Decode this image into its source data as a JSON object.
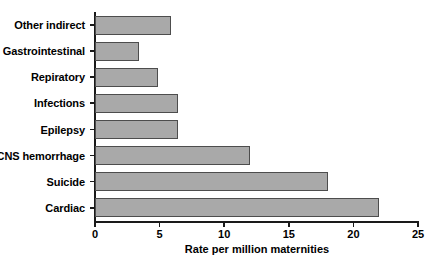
{
  "chart_data": {
    "type": "bar",
    "orientation": "horizontal",
    "title": "",
    "xlabel": "Rate per million maternities",
    "ylabel": "",
    "xlim": [
      0,
      25
    ],
    "xticks": [
      0,
      5,
      10,
      15,
      20,
      25
    ],
    "xtick_labels": [
      "0",
      "5",
      "10",
      "15",
      "20",
      "25"
    ],
    "grid": false,
    "legend": null,
    "bar_fill_color": "#a9a9a9",
    "bar_edge_color": "#4d4d4d",
    "axis_color": "#1a1a1a",
    "categories": [
      "Other indirect",
      "Gastrointestinal",
      "Repiratory",
      "Infections",
      "Epilepsy",
      "CNS hemorrhage",
      "Suicide",
      "Cardiac"
    ],
    "values": [
      5.9,
      3.4,
      4.9,
      6.4,
      6.4,
      12.0,
      18.0,
      22.0
    ]
  }
}
